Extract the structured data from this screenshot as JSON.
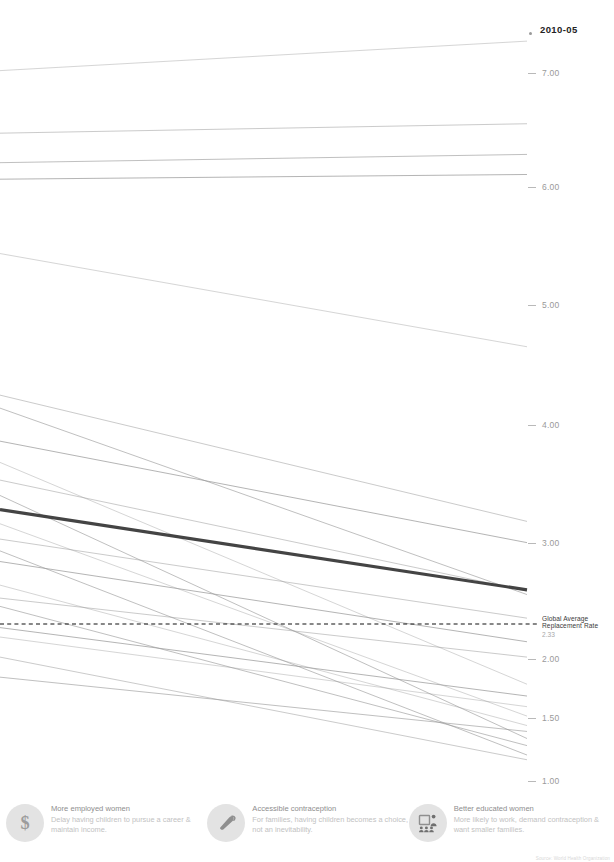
{
  "period_label": "2010-05",
  "axis": {
    "ticks": [
      {
        "value": "7.00",
        "y": 73
      },
      {
        "value": "6.00",
        "y": 187
      },
      {
        "value": "5.00",
        "y": 305
      },
      {
        "value": "4.00",
        "y": 425
      },
      {
        "value": "3.00",
        "y": 543
      },
      {
        "value": "2.00",
        "y": 659
      },
      {
        "value": "1.50",
        "y": 718
      },
      {
        "value": "1.00",
        "y": 781
      }
    ]
  },
  "annotation": {
    "line1": "Global Average",
    "line2": "Replacement Rate",
    "value": "2.33"
  },
  "legend": {
    "items": [
      {
        "icon": "dollar-sign-icon",
        "title": "More employed women",
        "desc": "Delay having children to pursue a career & maintain income."
      },
      {
        "icon": "condom-icon",
        "title": "Accessible contraception",
        "desc": "For families, having children becomes a choice, not an inevitability."
      },
      {
        "icon": "classroom-icon",
        "title": "Better educated women",
        "desc": "More likely to work, demand contraception & want smaller families."
      }
    ]
  },
  "source_credit": "Source: World Health Organization",
  "colors": {
    "line_default": "#9a9a9a",
    "line_highlight": "#3a3a3a",
    "tick": "#9a9a9a",
    "legend_icon_bg": "#e3e3e3"
  },
  "chart_data": {
    "type": "line",
    "title": "",
    "subtitle": "",
    "xlabel": "",
    "ylabel": "",
    "x": [
      "1960-65",
      "2010-05"
    ],
    "ylim": [
      1.0,
      7.25
    ],
    "grid": false,
    "legend_position": "none",
    "reference_line": {
      "label": "Global Average Replacement Rate",
      "value": 2.33,
      "style": "dashed"
    },
    "series": [
      {
        "name": "s01",
        "values": [
          7.02,
          7.27
        ],
        "highlight": false
      },
      {
        "name": "s02",
        "values": [
          6.49,
          6.57
        ],
        "highlight": false
      },
      {
        "name": "s03",
        "values": [
          6.24,
          6.31
        ],
        "highlight": false
      },
      {
        "name": "s04",
        "values": [
          6.1,
          6.14
        ],
        "highlight": false
      },
      {
        "name": "s05",
        "values": [
          5.47,
          4.68
        ],
        "highlight": false
      },
      {
        "name": "s06",
        "values": [
          4.27,
          3.2
        ],
        "highlight": false
      },
      {
        "name": "s07",
        "values": [
          4.16,
          2.58
        ],
        "highlight": false
      },
      {
        "name": "s08",
        "values": [
          3.88,
          3.02
        ],
        "highlight": false
      },
      {
        "name": "s09",
        "values": [
          3.7,
          1.82
        ],
        "highlight": false
      },
      {
        "name": "s10",
        "values": [
          3.55,
          2.61
        ],
        "highlight": false
      },
      {
        "name": "s11",
        "values": [
          3.42,
          1.36
        ],
        "highlight": false
      },
      {
        "name": "s12",
        "values": [
          3.3,
          2.62
        ],
        "highlight": true
      },
      {
        "name": "s13",
        "values": [
          3.18,
          1.55
        ],
        "highlight": false
      },
      {
        "name": "s14",
        "values": [
          3.05,
          2.38
        ],
        "highlight": false
      },
      {
        "name": "s15",
        "values": [
          2.95,
          1.22
        ],
        "highlight": false
      },
      {
        "name": "s16",
        "values": [
          2.86,
          2.18
        ],
        "highlight": false
      },
      {
        "name": "s17",
        "values": [
          2.66,
          1.47
        ],
        "highlight": false
      },
      {
        "name": "s18",
        "values": [
          2.55,
          2.05
        ],
        "highlight": false
      },
      {
        "name": "s19",
        "values": [
          2.48,
          1.3
        ],
        "highlight": false
      },
      {
        "name": "s20",
        "values": [
          2.3,
          1.72
        ],
        "highlight": false
      },
      {
        "name": "s21",
        "values": [
          2.22,
          1.63
        ],
        "highlight": false
      },
      {
        "name": "s22",
        "values": [
          2.05,
          1.18
        ],
        "highlight": false
      },
      {
        "name": "s23",
        "values": [
          1.88,
          1.42
        ],
        "highlight": false
      }
    ]
  }
}
